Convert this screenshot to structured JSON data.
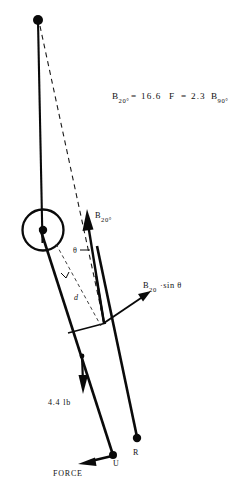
{
  "figure": {
    "background_color": "#ffffff",
    "ink_color": "#0a0a0a",
    "width": 245,
    "height": 489
  },
  "equation": {
    "full_text": "B20°= 16.6 F = 2.3 B90°",
    "lhs_base": "B",
    "lhs_sub": "20°",
    "eq1": "=",
    "value1": "16.6",
    "force_symbol": "F",
    "eq2": "=",
    "value2": "2.3",
    "rhs_base": "B",
    "rhs_sub": "90°"
  },
  "labels": {
    "muscle_force": {
      "base": "B",
      "sub": "20°"
    },
    "perpendicular_component": {
      "base": "B",
      "sub": "20",
      "suffix": "·sin θ"
    },
    "angle": "θ",
    "moment_arm": "d",
    "weight": "4.4 lb",
    "point_u": "U",
    "point_r": "R",
    "force": "FORCE"
  },
  "geometry": {
    "top_pivot_point": {
      "x": 38,
      "y": 20
    },
    "joint_circle": {
      "cx": 43,
      "cy": 230,
      "r": 20
    },
    "insertion_point": {
      "x": 104,
      "y": 323
    },
    "point_u": {
      "x": 113,
      "y": 455
    },
    "point_r": {
      "x": 137,
      "y": 438
    }
  },
  "vectors": [
    {
      "name": "muscle-force-B20",
      "from": [
        104,
        323
      ],
      "to": [
        87,
        212
      ],
      "style": "solid-arrow"
    },
    {
      "name": "perpendicular-component",
      "from": [
        104,
        323
      ],
      "to": [
        150,
        293
      ],
      "style": "solid-arrow"
    },
    {
      "name": "weight-4.4lb",
      "from": [
        82,
        355
      ],
      "to": [
        83,
        393
      ],
      "style": "solid-arrow"
    },
    {
      "name": "force-reaction",
      "from": [
        113,
        455
      ],
      "to": [
        80,
        463
      ],
      "style": "solid-arrow"
    }
  ]
}
